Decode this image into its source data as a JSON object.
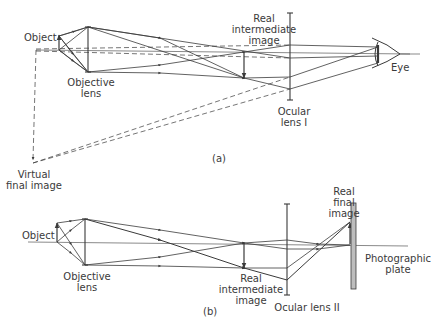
{
  "panels": [
    {
      "id": "a",
      "caption": "(a)",
      "labels": {
        "object": "Object",
        "objective_lens": "Objective\nlens",
        "real_intermediate_image": "Real\nintermediate\nimage",
        "ocular_lens": "Ocular\nlens I",
        "eye": "Eye",
        "virtual_final_image": "Virtual\nfinal image"
      }
    },
    {
      "id": "b",
      "caption": "(b)",
      "labels": {
        "object": "Object",
        "objective_lens": "Objective\nlens",
        "real_intermediate_image": "Real\nintermediate\nimage",
        "ocular_lens": "Ocular  lens II",
        "real_final_image": "Real\nfinal\nimage",
        "photographic_plate": "Photographic\nplate"
      }
    }
  ],
  "colors": {
    "line": "#3a3a3a",
    "plate_fill": "#bdbdbd",
    "background": "#ffffff"
  }
}
